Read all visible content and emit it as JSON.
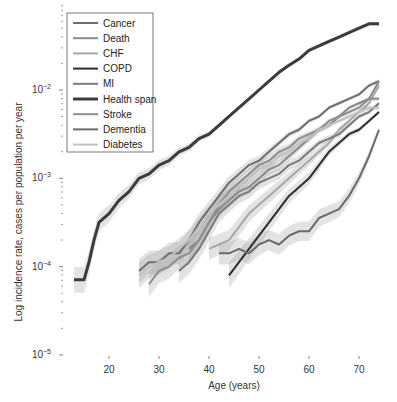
{
  "chart_data": {
    "type": "line",
    "title": "",
    "xlabel": "Age (years)",
    "ylabel": "Log incidence rate, cases per population per year",
    "yscale": "log",
    "xlim": [
      12,
      75
    ],
    "ylim": [
      1e-05,
      0.08
    ],
    "x_ticks": [
      20,
      30,
      40,
      50,
      60,
      70
    ],
    "y_ticks": [
      {
        "value": -2,
        "label": "10",
        "exp": "−2"
      },
      {
        "value": -3,
        "label": "10",
        "exp": "−3"
      },
      {
        "value": -4,
        "label": "10",
        "exp": "−4"
      },
      {
        "value": -5,
        "label": "10",
        "exp": "−5"
      }
    ],
    "grid": false,
    "legend_position": "upper left",
    "confidence_bands": true,
    "series": [
      {
        "name": "Cancer",
        "color": "#6e6e6e",
        "width": 2,
        "x": [
          26,
          28,
          30,
          32,
          34,
          36,
          38,
          40,
          42,
          44,
          46,
          48,
          50,
          52,
          54,
          56,
          58,
          60,
          62,
          64,
          66,
          68,
          70,
          72,
          74
        ],
        "log10": [
          -4.05,
          -3.95,
          -3.95,
          -3.85,
          -3.85,
          -3.7,
          -3.5,
          -3.35,
          -3.2,
          -3.05,
          -2.95,
          -2.85,
          -2.8,
          -2.7,
          -2.6,
          -2.5,
          -2.45,
          -2.35,
          -2.3,
          -2.2,
          -2.15,
          -2.1,
          -2.05,
          -1.95,
          -1.9
        ]
      },
      {
        "name": "Death",
        "color": "#8a8a8a",
        "width": 2,
        "x": [
          36,
          38,
          40,
          42,
          44,
          46,
          48,
          50,
          52,
          54,
          56,
          58,
          60,
          62,
          64,
          66,
          68,
          70,
          72,
          74
        ],
        "log10": [
          -3.8,
          -3.7,
          -3.5,
          -3.35,
          -3.25,
          -3.15,
          -3.1,
          -3.0,
          -2.9,
          -2.85,
          -2.75,
          -2.65,
          -2.55,
          -2.45,
          -2.4,
          -2.3,
          -2.2,
          -2.15,
          -2.1,
          -1.9
        ]
      },
      {
        "name": "CHF",
        "color": "#a8a8a8",
        "width": 2,
        "x": [
          40,
          42,
          44,
          46,
          48,
          50,
          52,
          54,
          56,
          58,
          60,
          62,
          64,
          66,
          68,
          70,
          72,
          74
        ],
        "log10": [
          -3.8,
          -3.75,
          -3.7,
          -3.55,
          -3.4,
          -3.3,
          -3.2,
          -3.1,
          -3.0,
          -2.9,
          -2.8,
          -2.7,
          -2.6,
          -2.45,
          -2.35,
          -2.25,
          -2.15,
          -1.95
        ]
      },
      {
        "name": "COPD",
        "color": "#2e2e2e",
        "width": 2,
        "x": [
          44,
          46,
          48,
          50,
          52,
          54,
          56,
          58,
          60,
          62,
          64,
          66,
          68,
          70,
          72,
          74
        ],
        "log10": [
          -4.1,
          -3.95,
          -3.8,
          -3.65,
          -3.5,
          -3.35,
          -3.2,
          -3.1,
          -3.0,
          -2.85,
          -2.7,
          -2.6,
          -2.5,
          -2.45,
          -2.35,
          -2.25
        ]
      },
      {
        "name": "MI",
        "color": "#7a7a7a",
        "width": 2,
        "x": [
          34,
          36,
          38,
          40,
          42,
          44,
          46,
          48,
          50,
          52,
          54,
          56,
          58,
          60,
          62,
          64,
          66,
          68,
          70,
          72,
          74
        ],
        "log10": [
          -4.05,
          -3.95,
          -3.8,
          -3.6,
          -3.4,
          -3.3,
          -3.2,
          -3.15,
          -3.05,
          -3.0,
          -2.95,
          -2.85,
          -2.8,
          -2.7,
          -2.6,
          -2.55,
          -2.5,
          -2.4,
          -2.3,
          -2.25,
          -2.15
        ]
      },
      {
        "name": "Health span",
        "color": "#3c3c3c",
        "width": 3,
        "x": [
          13,
          14,
          15,
          16,
          17,
          18,
          20,
          22,
          24,
          26,
          28,
          30,
          32,
          34,
          36,
          38,
          40,
          42,
          44,
          46,
          48,
          50,
          52,
          54,
          56,
          58,
          60,
          62,
          64,
          66,
          68,
          70,
          72,
          74
        ],
        "log10": [
          -4.15,
          -4.15,
          -4.15,
          -3.95,
          -3.7,
          -3.5,
          -3.4,
          -3.25,
          -3.15,
          -3.0,
          -2.95,
          -2.85,
          -2.8,
          -2.7,
          -2.65,
          -2.55,
          -2.5,
          -2.4,
          -2.3,
          -2.2,
          -2.1,
          -2.0,
          -1.9,
          -1.8,
          -1.72,
          -1.65,
          -1.55,
          -1.5,
          -1.45,
          -1.4,
          -1.35,
          -1.3,
          -1.25,
          -1.25
        ]
      },
      {
        "name": "Stroke",
        "color": "#8e8e8e",
        "width": 2,
        "x": [
          28,
          30,
          32,
          34,
          36,
          38,
          40,
          42,
          44,
          46,
          48,
          50,
          52,
          54,
          56,
          58,
          60,
          62,
          64,
          66,
          68,
          70,
          72,
          74
        ],
        "log10": [
          -4.2,
          -4.05,
          -4.0,
          -3.9,
          -3.85,
          -3.7,
          -3.5,
          -3.3,
          -3.15,
          -3.05,
          -2.95,
          -2.85,
          -2.8,
          -2.7,
          -2.65,
          -2.55,
          -2.5,
          -2.45,
          -2.35,
          -2.3,
          -2.25,
          -2.2,
          -2.1,
          -2.1
        ]
      },
      {
        "name": "Dementia",
        "color": "#6a6a6a",
        "width": 2,
        "x": [
          42,
          44,
          46,
          48,
          50,
          52,
          54,
          56,
          58,
          60,
          62,
          64,
          66,
          68,
          70,
          72,
          74
        ],
        "log10": [
          -3.85,
          -3.85,
          -3.8,
          -3.85,
          -3.75,
          -3.7,
          -3.75,
          -3.65,
          -3.6,
          -3.6,
          -3.45,
          -3.4,
          -3.35,
          -3.2,
          -3.0,
          -2.75,
          -2.45
        ]
      },
      {
        "name": "Diabetes",
        "color": "#c2c2c2",
        "width": 2,
        "x": [
          26,
          28,
          30,
          32,
          34,
          36,
          38,
          40,
          42,
          44,
          46,
          48,
          50,
          52,
          54,
          56,
          58,
          60,
          62,
          64,
          66,
          68,
          70,
          72,
          74
        ],
        "log10": [
          -4.1,
          -4.0,
          -3.95,
          -3.9,
          -3.8,
          -3.7,
          -3.55,
          -3.4,
          -3.3,
          -3.2,
          -3.1,
          -3.0,
          -2.9,
          -2.85,
          -2.75,
          -2.7,
          -2.6,
          -2.55,
          -2.45,
          -2.4,
          -2.35,
          -2.3,
          -2.25,
          -2.2,
          -2.2
        ]
      }
    ]
  },
  "legend": {
    "items": [
      "Cancer",
      "Death",
      "CHF",
      "COPD",
      "MI",
      "Health span",
      "Stroke",
      "Dementia",
      "Diabetes"
    ]
  },
  "axes": {
    "x_title": "Age (years)",
    "y_title": "Log incidence rate, cases per population per year"
  }
}
